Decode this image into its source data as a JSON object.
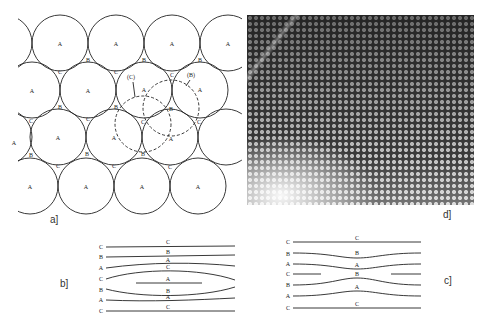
{
  "figure": {
    "panels": {
      "a": {
        "label": "a]",
        "description": "Close-packed layer of spheres (A) with B and C interstitial sites; dashed circles show shifted positions (C) and (B)",
        "circle_labels": "A",
        "site_labels": [
          "B",
          "C"
        ],
        "dashed_labels": {
          "c": "(C)",
          "b": "(B)"
        }
      },
      "b": {
        "label": "b]",
        "stacking": [
          "C",
          "B",
          "A",
          "C",
          "B",
          "A",
          "C"
        ],
        "line_labels": [
          "C",
          "B",
          "A",
          "C",
          "A",
          "B",
          "A",
          "C"
        ]
      },
      "c": {
        "label": "c]",
        "stacking": [
          "C",
          "B",
          "A",
          "C",
          "B",
          "A",
          "C"
        ],
        "line_labels": [
          "C",
          "B",
          "A",
          "B",
          "A",
          "C"
        ]
      },
      "d": {
        "label": "d]",
        "description": "High-resolution lattice image micrograph"
      }
    },
    "colors": {
      "ink": "#1a1a1a",
      "background": "#ffffff"
    }
  }
}
